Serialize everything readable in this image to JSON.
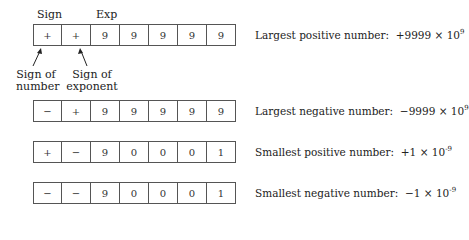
{
  "header_labels": {
    "sign": "Sign",
    "exp": "Exp"
  },
  "annotations": {
    "sign_of_number_line1": "Sign of",
    "sign_of_number_line2": "number",
    "sign_of_exponent_line1": "Sign of",
    "sign_of_exponent_line2": "exponent"
  },
  "rows": [
    {
      "cells": [
        "+",
        "+",
        "9",
        "9",
        "9",
        "9",
        "9"
      ],
      "description": "Largest positive number:",
      "value_mantissa": "+9999 × 10",
      "value_exponent": "9"
    },
    {
      "cells": [
        "−",
        "+",
        "9",
        "9",
        "9",
        "9",
        "9"
      ],
      "description": "Largest negative number:",
      "value_mantissa": "−9999 × 10",
      "value_exponent": "9"
    },
    {
      "cells": [
        "+",
        "−",
        "9",
        "0",
        "0",
        "0",
        "1"
      ],
      "description": "Smallest positive number:",
      "value_mantissa": "+1 × 10",
      "value_exponent": "-9"
    },
    {
      "cells": [
        "−",
        "−",
        "9",
        "0",
        "0",
        "0",
        "1"
      ],
      "description": "Smallest negative number:",
      "value_mantissa": "−1 × 10",
      "value_exponent": "-9"
    }
  ]
}
